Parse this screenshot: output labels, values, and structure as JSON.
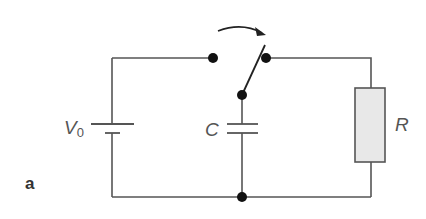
{
  "figure": {
    "panel_label": "a",
    "components": {
      "battery": {
        "label_main": "V",
        "label_sub": "0"
      },
      "capacitor": {
        "label": "C"
      },
      "resistor": {
        "label": "R"
      },
      "switch": {
        "state": "open, moving toward right contact"
      }
    },
    "colors": {
      "wire": "#555555",
      "node": "#111111",
      "resistor_fill": "#e8e8e8",
      "label": "#555555"
    }
  }
}
